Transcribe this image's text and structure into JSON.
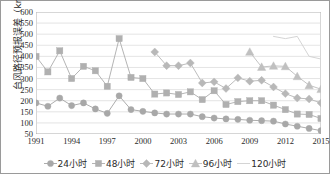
{
  "chart_data": {
    "type": "line",
    "title": "",
    "xlabel": "",
    "ylabel": "台风路径预报误差（km）",
    "ylim": [
      50,
      600
    ],
    "ytick_step": 50,
    "yticks": [
      600,
      550,
      500,
      450,
      400,
      350,
      300,
      250,
      200,
      150,
      100,
      50
    ],
    "xlim": [
      1991,
      2015
    ],
    "xticks": [
      1991,
      1994,
      1997,
      2000,
      2003,
      2006,
      2009,
      2012,
      2015
    ],
    "x": [
      1991,
      1992,
      1993,
      1994,
      1995,
      1996,
      1997,
      1998,
      1999,
      2000,
      2001,
      2002,
      2003,
      2004,
      2005,
      2006,
      2007,
      2008,
      2009,
      2010,
      2011,
      2012,
      2013,
      2014,
      2015
    ],
    "grid": "horizontal",
    "legend_position": "bottom",
    "series": [
      {
        "name": "24小时",
        "marker": "circle",
        "color": "#a8a8a8",
        "values": [
          190,
          175,
          212,
          178,
          190,
          163,
          143,
          222,
          160,
          152,
          145,
          140,
          140,
          140,
          128,
          122,
          118,
          116,
          112,
          110,
          108,
          95,
          85,
          75,
          65
        ]
      },
      {
        "name": "48小时",
        "marker": "square",
        "color": "#b0b0b0",
        "values": [
          400,
          330,
          425,
          300,
          355,
          335,
          265,
          480,
          305,
          300,
          230,
          235,
          228,
          240,
          205,
          245,
          183,
          196,
          200,
          200,
          180,
          160,
          140,
          138,
          120
        ]
      },
      {
        "name": "72小时",
        "marker": "diamond",
        "color": "#b8b8b8",
        "values": [
          null,
          null,
          null,
          null,
          null,
          null,
          null,
          null,
          null,
          null,
          420,
          358,
          358,
          370,
          280,
          285,
          255,
          303,
          288,
          292,
          262,
          232,
          212,
          208,
          190
        ]
      },
      {
        "name": "96小时",
        "marker": "triangle",
        "color": "#c0c0c0",
        "values": [
          null,
          null,
          null,
          null,
          null,
          null,
          null,
          null,
          null,
          null,
          null,
          null,
          null,
          null,
          null,
          null,
          null,
          null,
          420,
          352,
          357,
          355,
          310,
          270,
          252
        ]
      },
      {
        "name": "120小时",
        "marker": "none",
        "color": "#d2d2d2",
        "values": [
          null,
          null,
          null,
          null,
          null,
          null,
          null,
          null,
          null,
          null,
          null,
          null,
          null,
          null,
          null,
          null,
          null,
          null,
          null,
          null,
          490,
          480,
          490,
          400,
          388
        ]
      }
    ]
  },
  "legend": {
    "items": [
      {
        "label": "24小时"
      },
      {
        "label": "48小时"
      },
      {
        "label": "72小时"
      },
      {
        "label": "96小时"
      },
      {
        "label": "120小时"
      }
    ]
  }
}
